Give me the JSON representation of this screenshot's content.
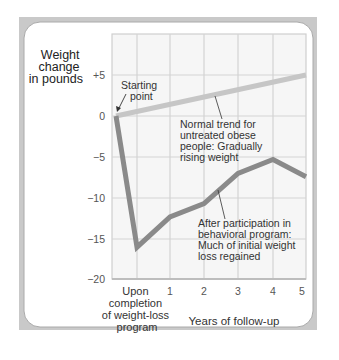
{
  "chart_data": {
    "type": "line",
    "title": "",
    "ylabel": "Weight change in pounds",
    "ylabel_lines": [
      "Weight",
      "change",
      "in pounds"
    ],
    "xlabel": "Years of follow-up",
    "ylim": [
      -20,
      7
    ],
    "yticks": [
      "+5",
      "0",
      "−5",
      "−10",
      "−15",
      "−20"
    ],
    "xticks": [
      "Upon completion of weight-loss program",
      "1",
      "2",
      "3",
      "4",
      "5"
    ],
    "xtick_first_lines": [
      "Upon",
      "completion",
      "of weight-loss",
      "program"
    ],
    "grid": true,
    "legend": "none (inline annotations)",
    "series": [
      {
        "name": "Normal trend for untreated obese people: Gradually rising weight",
        "color": "#c6c6c6",
        "x": [
          "Start",
          "5"
        ],
        "values": [
          0,
          5
        ]
      },
      {
        "name": "After participation in behavioral program: Much of initial weight loss regained",
        "color": "#8a8a8a",
        "x": [
          "Start",
          "Upon completion",
          "1",
          "2",
          "3",
          "4",
          "5"
        ],
        "values": [
          0,
          -16,
          -12.3,
          -10.7,
          -7,
          -5.3,
          -7.4
        ]
      }
    ],
    "annotations": {
      "starting_point": [
        "Starting",
        "point"
      ],
      "normal_trend": [
        "Normal trend for",
        "untreated obese",
        "people: Gradually",
        "rising weight"
      ],
      "after_program": [
        "After participation in",
        "behavioral program:",
        "Much of initial weight",
        "loss regained"
      ]
    }
  }
}
